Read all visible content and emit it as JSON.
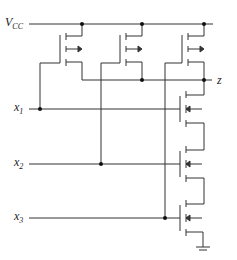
{
  "diagram": {
    "type": "nMOS pseudo-load logic gate (three inputs, depletion loads)",
    "labels": {
      "supply": "V",
      "supply_sub": "CC",
      "output": "z",
      "inputs": [
        {
          "name": "x",
          "sub": "1"
        },
        {
          "name": "x",
          "sub": "2"
        },
        {
          "name": "x",
          "sub": "3"
        }
      ]
    },
    "colors": {
      "wire": "#333333",
      "background": "#ffffff"
    }
  }
}
